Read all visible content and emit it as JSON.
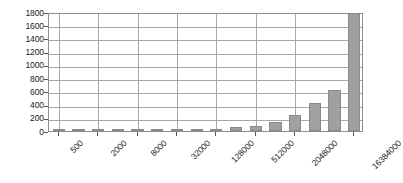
{
  "chart_data": {
    "type": "bar",
    "title": "",
    "subtitle": "",
    "xlabel": "",
    "ylabel": "",
    "grid": true,
    "legend": false,
    "legend_position": "none",
    "ylim": [
      0,
      1800
    ],
    "yticks": [
      0,
      200,
      400,
      600,
      800,
      1000,
      1200,
      1400,
      1600,
      1800
    ],
    "ytick_labels": [
      "0",
      "200",
      "400",
      "600",
      "800",
      "1000",
      "1200",
      "1400",
      "1600",
      "1800"
    ],
    "xtick_labels": [
      "500",
      "2000",
      "8000",
      "32000",
      "128000",
      "512000",
      "2048000",
      "16384000"
    ],
    "xtick_indices": [
      0,
      2,
      4,
      6,
      8,
      10,
      12,
      15
    ],
    "categories": [
      "500",
      "1000",
      "2000",
      "4000",
      "8000",
      "16000",
      "32000",
      "64000",
      "128000",
      "256000",
      "512000",
      "1024000",
      "2048000",
      "4096000",
      "8192000",
      "16384000"
    ],
    "values": [
      2,
      3,
      4,
      6,
      9,
      13,
      18,
      26,
      38,
      55,
      80,
      130,
      240,
      420,
      620,
      870
    ],
    "values_note": "last visible bar 16384000 reaches 1780",
    "bar_color": "#a0a0a0",
    "bar_border_color": "#8a8a8a",
    "grid_color": "#a8a8a8",
    "frame_color": "#8d8d8d",
    "text_color": "#1a1a1a"
  },
  "overrides": {
    "final_bar_value": 1780
  }
}
